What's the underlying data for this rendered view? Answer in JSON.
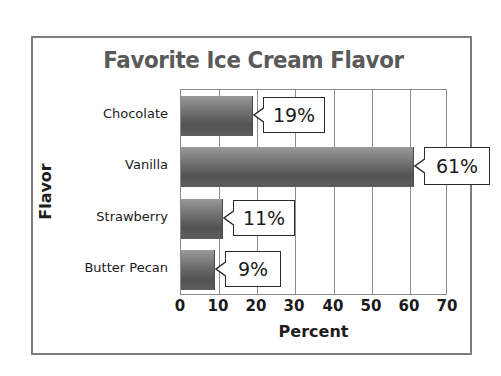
{
  "chart_data": {
    "type": "bar",
    "orientation": "horizontal",
    "title": "Favorite Ice Cream Flavor",
    "xlabel": "Percent",
    "ylabel": "Flavor",
    "categories": [
      "Chocolate",
      "Vanilla",
      "Strawberry",
      "Butter Pecan"
    ],
    "values": [
      19,
      61,
      11,
      9
    ],
    "data_labels": [
      "19%",
      "61%",
      "11%",
      "9%"
    ],
    "xlim": [
      0,
      70
    ],
    "xticks": [
      0,
      10,
      20,
      30,
      40,
      50,
      60,
      70
    ],
    "xtick_labels": [
      "0",
      "10",
      "20",
      "30",
      "40",
      "50",
      "60",
      "70"
    ],
    "grid": "vertical",
    "legend": "none",
    "colors": {
      "bar_light": "#9a9a9a",
      "bar_dark": "#535353",
      "title": "#5a5a5a",
      "frame": "#7d7d7d",
      "axis": "#8a8a8a",
      "text": "#1a1a1a",
      "callout_border": "#2b2b2b",
      "background": "#ffffff"
    }
  }
}
